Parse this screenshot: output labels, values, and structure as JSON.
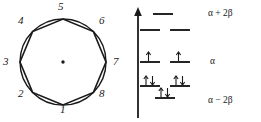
{
  "figure": {
    "colors": {
      "ink": "#1a1a1a",
      "background": "#ffffff"
    }
  },
  "frost_circle": {
    "name": "frost-circle",
    "shape": "octagon-in-circle",
    "center_dot": "·",
    "vertices": [
      {
        "number": "1",
        "angle_deg": 270,
        "label_x": 60,
        "label_y": 104
      },
      {
        "number": "2",
        "angle_deg": 225,
        "label_x": 18,
        "label_y": 88
      },
      {
        "number": "3",
        "angle_deg": 180,
        "label_x": 3,
        "label_y": 56
      },
      {
        "number": "4",
        "angle_deg": 135,
        "label_x": 18,
        "label_y": 15
      },
      {
        "number": "5",
        "angle_deg": 90,
        "label_x": 58,
        "label_y": 1
      },
      {
        "number": "6",
        "angle_deg": 45,
        "label_x": 99,
        "label_y": 15
      },
      {
        "number": "7",
        "angle_deg": 0,
        "label_x": 113,
        "label_y": 56
      },
      {
        "number": "8",
        "angle_deg": 315,
        "label_x": 99,
        "label_y": 88
      }
    ]
  },
  "mo_diagram": {
    "name": "huckel-mo-diagram",
    "energy_axis": {
      "name": "energy-axis-arrow",
      "direction": "up"
    },
    "levels": [
      {
        "id": "antibonding-top",
        "energy_label": "α + 2β",
        "show_energy_label": true,
        "label_x": 78,
        "label_y": 9,
        "orbitals": [
          {
            "x": 33,
            "y": 14,
            "electrons": 0
          }
        ]
      },
      {
        "id": "antibonding-degenerate",
        "energy_label": "",
        "show_energy_label": false,
        "label_x": 0,
        "label_y": 0,
        "orbitals": [
          {
            "x": 20,
            "y": 30,
            "electrons": 0
          },
          {
            "x": 50,
            "y": 30,
            "electrons": 0
          }
        ]
      },
      {
        "id": "nonbonding",
        "energy_label": "α",
        "show_energy_label": true,
        "label_x": 80,
        "label_y": 57,
        "orbitals": [
          {
            "x": 20,
            "y": 62,
            "electrons": 1
          },
          {
            "x": 50,
            "y": 62,
            "electrons": 1
          }
        ]
      },
      {
        "id": "bonding-degenerate",
        "energy_label": "",
        "show_energy_label": false,
        "label_x": 0,
        "label_y": 0,
        "orbitals": [
          {
            "x": 20,
            "y": 86,
            "electrons": 2
          },
          {
            "x": 50,
            "y": 86,
            "electrons": 2
          }
        ]
      },
      {
        "id": "bonding-bottom",
        "energy_label": "α − 2β",
        "show_energy_label": true,
        "label_x": 78,
        "label_y": 96,
        "orbitals": [
          {
            "x": 35,
            "y": 98,
            "electrons": 2
          }
        ]
      }
    ]
  }
}
